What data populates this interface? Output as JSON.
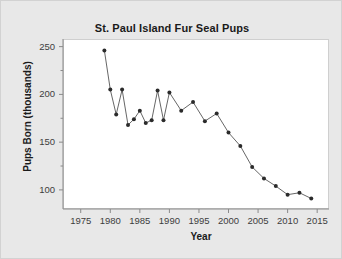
{
  "chart_data": {
    "type": "line",
    "title": "St. Paul Island Fur Seal Pups",
    "xlabel": "Year",
    "ylabel": "Pups Born (thousands)",
    "xlim": [
      1972,
      2017
    ],
    "ylim": [
      80,
      258
    ],
    "grid": false,
    "legend": null,
    "marker": "filled-circle",
    "marker_color": "#2b2b2b",
    "line_color": "#555555",
    "xticks": [
      1975,
      1980,
      1985,
      1990,
      1995,
      2000,
      2005,
      2010,
      2015
    ],
    "xtick_labels": [
      "1975",
      "1980",
      "1985",
      "1990",
      "1995",
      "2000",
      "2005",
      "2010",
      "2015"
    ],
    "yticks": [
      100,
      150,
      200,
      250
    ],
    "ytick_labels": [
      "100",
      "150",
      "200",
      "250"
    ],
    "yminorticks": [
      125,
      175,
      225
    ],
    "x": [
      1979,
      1980,
      1981,
      1982,
      1983,
      1984,
      1985,
      1986,
      1987,
      1988,
      1989,
      1990,
      1992,
      1994,
      1996,
      1998,
      2000,
      2002,
      2004,
      2006,
      2008,
      2010,
      2012,
      2014
    ],
    "values": [
      246,
      205,
      179,
      205,
      168,
      174,
      183,
      170,
      173,
      204,
      173,
      202,
      183,
      192,
      172,
      180,
      160,
      146,
      124,
      112,
      104,
      95,
      97,
      91
    ],
    "series": [
      {
        "name": "Pups Born",
        "points": [
          {
            "x": 1979,
            "y": 246
          },
          {
            "x": 1980,
            "y": 205
          },
          {
            "x": 1981,
            "y": 179
          },
          {
            "x": 1982,
            "y": 205
          },
          {
            "x": 1983,
            "y": 168
          },
          {
            "x": 1984,
            "y": 174
          },
          {
            "x": 1985,
            "y": 183
          },
          {
            "x": 1986,
            "y": 170
          },
          {
            "x": 1987,
            "y": 173
          },
          {
            "x": 1988,
            "y": 204
          },
          {
            "x": 1989,
            "y": 173
          },
          {
            "x": 1990,
            "y": 202
          },
          {
            "x": 1992,
            "y": 183
          },
          {
            "x": 1994,
            "y": 192
          },
          {
            "x": 1996,
            "y": 172
          },
          {
            "x": 1998,
            "y": 180
          },
          {
            "x": 2000,
            "y": 160
          },
          {
            "x": 2002,
            "y": 146
          },
          {
            "x": 2004,
            "y": 124
          },
          {
            "x": 2006,
            "y": 112
          },
          {
            "x": 2008,
            "y": 104
          },
          {
            "x": 2010,
            "y": 95
          },
          {
            "x": 2012,
            "y": 97
          },
          {
            "x": 2014,
            "y": 91
          }
        ]
      }
    ]
  },
  "figure": {
    "background_color": "#e8e8e8",
    "plot_background_color": "#ffffff",
    "border_color": "#cfcfcf"
  }
}
